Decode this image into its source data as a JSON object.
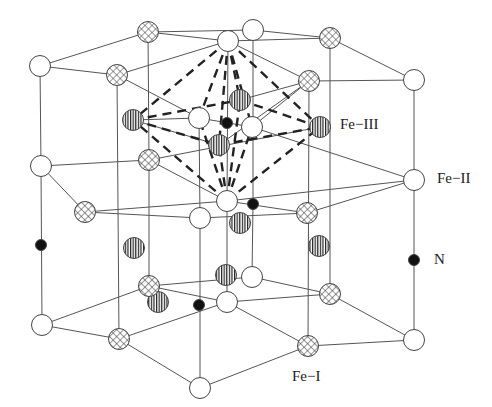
{
  "diagram": {
    "labels": [
      {
        "id": "fe3",
        "text": "Fe−III",
        "x": 340,
        "y": 116
      },
      {
        "id": "fe2",
        "text": "Fe−II",
        "x": 437,
        "y": 170
      },
      {
        "id": "n",
        "text": "N",
        "x": 434,
        "y": 251
      },
      {
        "id": "fe1",
        "text": "Fe−I",
        "x": 292,
        "y": 368
      }
    ],
    "legend": {
      "white": "Fe-II site (open circle)",
      "cross": "Fe-I site (cross-hatched circle)",
      "striped": "Fe-III site (vertically striped circle)",
      "black": "N atom (solid dot)"
    },
    "colors": {
      "line": "#555555",
      "dash": "#222222",
      "fill_black": "#111111",
      "outline": "#444444"
    },
    "atoms": [
      {
        "t": "white",
        "x": 40,
        "y": 66
      },
      {
        "t": "cross",
        "x": 117,
        "y": 75
      },
      {
        "t": "cross",
        "x": 148,
        "y": 32
      },
      {
        "t": "white",
        "x": 228,
        "y": 41
      },
      {
        "t": "white",
        "x": 253,
        "y": 30
      },
      {
        "t": "cross",
        "x": 330,
        "y": 38
      },
      {
        "t": "cross",
        "x": 309,
        "y": 81
      },
      {
        "t": "white",
        "x": 414,
        "y": 80
      },
      {
        "t": "striped",
        "x": 133,
        "y": 120
      },
      {
        "t": "white",
        "x": 199,
        "y": 118
      },
      {
        "t": "black",
        "x": 227,
        "y": 123
      },
      {
        "t": "white",
        "x": 252,
        "y": 127
      },
      {
        "t": "striped",
        "x": 240,
        "y": 100
      },
      {
        "t": "striped",
        "x": 219,
        "y": 145
      },
      {
        "t": "striped",
        "x": 320,
        "y": 127
      },
      {
        "t": "white",
        "x": 41,
        "y": 166
      },
      {
        "t": "cross",
        "x": 149,
        "y": 160
      },
      {
        "t": "white",
        "x": 227,
        "y": 201
      },
      {
        "t": "white",
        "x": 200,
        "y": 218
      },
      {
        "t": "black",
        "x": 253,
        "y": 204
      },
      {
        "t": "cross",
        "x": 307,
        "y": 213
      },
      {
        "t": "cross",
        "x": 85,
        "y": 212
      },
      {
        "t": "white",
        "x": 414,
        "y": 180
      },
      {
        "t": "striped",
        "x": 134,
        "y": 248
      },
      {
        "t": "striped",
        "x": 240,
        "y": 223
      },
      {
        "t": "striped",
        "x": 319,
        "y": 246
      },
      {
        "t": "striped",
        "x": 158,
        "y": 302
      },
      {
        "t": "striped",
        "x": 226,
        "y": 275
      },
      {
        "t": "black",
        "x": 41,
        "y": 245
      },
      {
        "t": "black",
        "x": 414,
        "y": 260
      },
      {
        "t": "white",
        "x": 42,
        "y": 325
      },
      {
        "t": "cross",
        "x": 149,
        "y": 286
      },
      {
        "t": "cross",
        "x": 119,
        "y": 339
      },
      {
        "t": "white",
        "x": 227,
        "y": 302
      },
      {
        "t": "white",
        "x": 252,
        "y": 277
      },
      {
        "t": "black",
        "x": 199,
        "y": 305
      },
      {
        "t": "cross",
        "x": 330,
        "y": 294
      },
      {
        "t": "cross",
        "x": 308,
        "y": 346
      },
      {
        "t": "white",
        "x": 414,
        "y": 340
      },
      {
        "t": "white",
        "x": 200,
        "y": 388
      }
    ],
    "lines": [
      [
        40,
        66,
        148,
        32
      ],
      [
        40,
        66,
        117,
        75
      ],
      [
        148,
        32,
        228,
        41
      ],
      [
        148,
        32,
        253,
        30
      ],
      [
        253,
        30,
        330,
        38
      ],
      [
        228,
        41,
        330,
        38
      ],
      [
        330,
        38,
        414,
        80
      ],
      [
        117,
        75,
        228,
        41
      ],
      [
        309,
        81,
        414,
        80
      ],
      [
        309,
        81,
        252,
        127
      ],
      [
        117,
        75,
        199,
        118
      ],
      [
        228,
        41,
        309,
        81
      ],
      [
        133,
        120,
        199,
        118
      ],
      [
        199,
        118,
        252,
        127
      ],
      [
        240,
        100,
        309,
        81
      ],
      [
        219,
        145,
        133,
        120
      ],
      [
        219,
        145,
        309,
        81
      ],
      [
        41,
        166,
        149,
        160
      ],
      [
        41,
        166,
        85,
        212
      ],
      [
        149,
        160,
        320,
        127
      ],
      [
        149,
        160,
        227,
        201
      ],
      [
        85,
        212,
        227,
        201
      ],
      [
        85,
        212,
        200,
        218
      ],
      [
        227,
        201,
        307,
        213
      ],
      [
        200,
        218,
        307,
        213
      ],
      [
        307,
        213,
        414,
        180
      ],
      [
        227,
        201,
        414,
        180
      ],
      [
        252,
        127,
        414,
        180
      ],
      [
        42,
        325,
        149,
        286
      ],
      [
        42,
        325,
        119,
        339
      ],
      [
        149,
        286,
        227,
        302
      ],
      [
        149,
        286,
        252,
        277
      ],
      [
        252,
        277,
        330,
        294
      ],
      [
        227,
        302,
        330,
        294
      ],
      [
        330,
        294,
        414,
        340
      ],
      [
        119,
        339,
        227,
        302
      ],
      [
        308,
        346,
        414,
        340
      ],
      [
        119,
        339,
        200,
        388
      ],
      [
        200,
        388,
        308,
        346
      ],
      [
        227,
        302,
        308,
        346
      ],
      [
        40,
        66,
        41,
        166
      ],
      [
        41,
        166,
        42,
        325
      ],
      [
        414,
        80,
        414,
        180
      ],
      [
        414,
        180,
        414,
        340
      ],
      [
        148,
        32,
        149,
        160
      ],
      [
        117,
        75,
        119,
        339
      ],
      [
        149,
        160,
        149,
        286
      ],
      [
        330,
        38,
        330,
        294
      ],
      [
        309,
        81,
        308,
        346
      ],
      [
        228,
        41,
        227,
        201
      ],
      [
        227,
        201,
        227,
        302
      ],
      [
        253,
        30,
        253,
        204
      ],
      [
        253,
        204,
        252,
        277
      ],
      [
        199,
        118,
        200,
        218
      ],
      [
        200,
        218,
        200,
        388
      ],
      [
        85,
        212,
        85,
        212
      ]
    ],
    "dashes": [
      [
        228,
        41,
        133,
        120
      ],
      [
        228,
        41,
        320,
        127
      ],
      [
        228,
        41,
        219,
        145
      ],
      [
        228,
        41,
        240,
        100
      ],
      [
        228,
        41,
        199,
        118
      ],
      [
        228,
        41,
        252,
        127
      ],
      [
        133,
        120,
        240,
        100
      ],
      [
        240,
        100,
        320,
        127
      ],
      [
        133,
        120,
        219,
        145
      ],
      [
        219,
        145,
        320,
        127
      ],
      [
        227,
        201,
        133,
        120
      ],
      [
        227,
        201,
        320,
        127
      ],
      [
        227,
        201,
        219,
        145
      ],
      [
        227,
        201,
        240,
        100
      ],
      [
        227,
        201,
        199,
        118
      ],
      [
        227,
        201,
        252,
        127
      ]
    ]
  }
}
